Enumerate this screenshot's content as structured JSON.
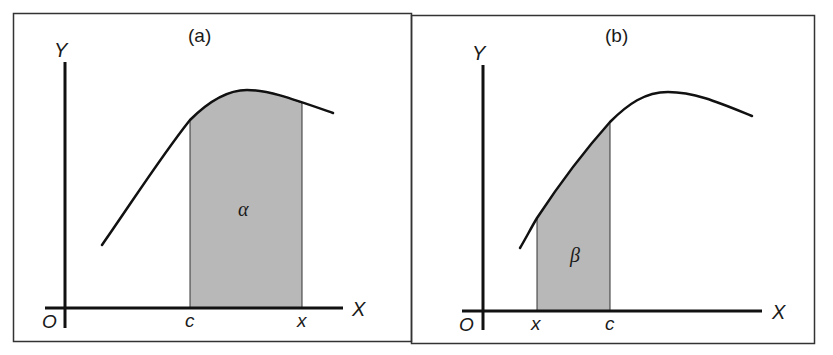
{
  "figure": {
    "panels": [
      {
        "id": "a",
        "title": "(a)",
        "y_axis_label": "Y",
        "x_axis_label": "X",
        "origin_label": "O",
        "ticks": [
          {
            "label": "c",
            "position": "left bound of shaded region"
          },
          {
            "label": "x",
            "position": "right bound of shaded region"
          }
        ],
        "region_label": "α",
        "region_color": "#b8b8b8"
      },
      {
        "id": "b",
        "title": "(b)",
        "y_axis_label": "Y",
        "x_axis_label": "X",
        "origin_label": "O",
        "ticks": [
          {
            "label": "x",
            "position": "left bound of shaded region"
          },
          {
            "label": "c",
            "position": "right bound of shaded region"
          }
        ],
        "region_label": "β",
        "region_color": "#b8b8b8"
      }
    ],
    "colors": {
      "line": "#111111",
      "border": "#333333",
      "fill": "#b8b8b8",
      "background": "#ffffff"
    }
  }
}
